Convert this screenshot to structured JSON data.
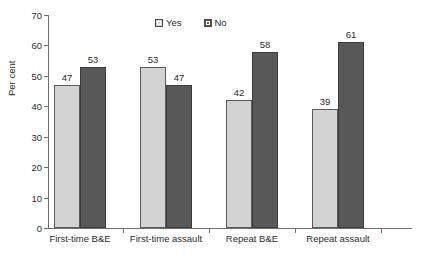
{
  "chart_data": {
    "type": "bar",
    "title": "",
    "xlabel": "",
    "ylabel": "Per cent",
    "ylim": [
      0,
      70
    ],
    "yticks": [
      0,
      10,
      20,
      30,
      40,
      50,
      60,
      70
    ],
    "ytick_labels": [
      "0",
      "10",
      "20",
      "30",
      "40",
      "50",
      "60",
      "70"
    ],
    "grid": false,
    "legend_position": "top-center",
    "categories": [
      "First-time B&E",
      "First-time assault",
      "Repeat B&E",
      "Repeat assault"
    ],
    "series": [
      {
        "name": "Yes",
        "color": "#d3d3d3",
        "values": [
          47,
          53,
          42,
          39
        ],
        "value_labels": [
          "47",
          "53",
          "42",
          "39"
        ]
      },
      {
        "name": "No",
        "color": "#585858",
        "values": [
          53,
          47,
          58,
          61
        ],
        "value_labels": [
          "53",
          "47",
          "58",
          "61"
        ]
      }
    ]
  },
  "legend": {
    "items": [
      {
        "label": "Yes",
        "swatch_name": "legend-swatch-yes"
      },
      {
        "label": "No",
        "swatch_name": "legend-swatch-no"
      }
    ]
  },
  "axis": {
    "y_title": "Per cent"
  },
  "caption": {
    "cropped_text": ""
  },
  "colors": {
    "series_yes": "#d3d3d3",
    "series_no": "#585858",
    "axis": "#6d6d6d",
    "text": "#2b2b2b",
    "background": "#ffffff"
  }
}
